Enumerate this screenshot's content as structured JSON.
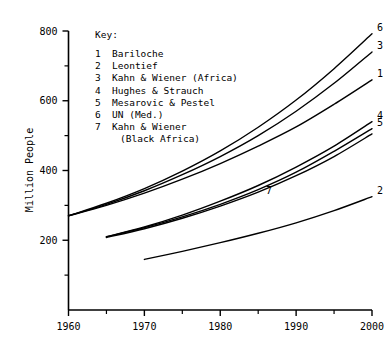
{
  "chart_data": {
    "type": "line",
    "title": "",
    "xlabel": "",
    "ylabel": "Million People",
    "xlim": [
      1960,
      2000
    ],
    "ylim": [
      0,
      800
    ],
    "grid": false,
    "legend_position": "inside-upper-left",
    "legend_title": "Key:",
    "x_ticks": [
      1960,
      1970,
      1980,
      1990,
      2000
    ],
    "x_tick_labels": [
      "1960",
      "1970",
      "1980",
      "1990",
      "2000"
    ],
    "x_minor_ticks": [
      1965,
      1975,
      1985,
      1995
    ],
    "y_ticks": [
      200,
      400,
      600,
      800
    ],
    "y_tick_labels": [
      "200",
      "400",
      "600",
      "800"
    ],
    "y_minor_ticks": [
      100,
      300,
      500,
      700
    ],
    "series": [
      {
        "key": "1",
        "name": "Bariloche",
        "label": "1",
        "x": [
          1960,
          1965,
          1970,
          1975,
          1980,
          1985,
          1990,
          1995,
          2000
        ],
        "values": [
          270,
          300,
          335,
          375,
          420,
          470,
          525,
          590,
          660
        ]
      },
      {
        "key": "2",
        "name": "Leontief",
        "label": "2",
        "x": [
          1970,
          1975,
          1980,
          1985,
          1990,
          1995,
          2000
        ],
        "values": [
          145,
          168,
          193,
          220,
          250,
          285,
          325
        ]
      },
      {
        "key": "3",
        "name": "Kahn & Wiener (Africa)",
        "label": "3",
        "x": [
          1960,
          1965,
          1970,
          1975,
          1980,
          1985,
          1990,
          1995,
          2000
        ],
        "values": [
          270,
          303,
          342,
          388,
          440,
          500,
          570,
          650,
          740
        ]
      },
      {
        "key": "4",
        "name": "Hughes & Strauch",
        "label": "4",
        "x": [
          1965,
          1970,
          1975,
          1980,
          1985,
          1990,
          1995,
          2000
        ],
        "values": [
          210,
          238,
          272,
          312,
          357,
          410,
          470,
          540
        ]
      },
      {
        "key": "5",
        "name": "Mesarovic & Pestel",
        "label": "5",
        "x": [
          1965,
          1970,
          1975,
          1980,
          1985,
          1990,
          1995,
          2000
        ],
        "values": [
          210,
          236,
          267,
          303,
          345,
          395,
          455,
          520
        ]
      },
      {
        "key": "6",
        "name": "UN (Med.)",
        "label": "6",
        "x": [
          1960,
          1965,
          1970,
          1975,
          1980,
          1985,
          1990,
          1995,
          2000
        ],
        "values": [
          270,
          306,
          348,
          398,
          456,
          524,
          602,
          692,
          792
        ]
      },
      {
        "key": "7",
        "name": "Kahn & Wiener (Black Africa)",
        "label": "7",
        "x": [
          1965,
          1970,
          1975,
          1980,
          1985,
          1990,
          1995,
          2000
        ],
        "values": [
          208,
          233,
          263,
          298,
          338,
          385,
          440,
          505
        ]
      }
    ],
    "legend_entries": [
      {
        "num": "1",
        "text": "Bariloche",
        "text2": ""
      },
      {
        "num": "2",
        "text": "Leontief",
        "text2": ""
      },
      {
        "num": "3",
        "text": "Kahn & Wiener (Africa)",
        "text2": ""
      },
      {
        "num": "4",
        "text": "Hughes & Strauch",
        "text2": ""
      },
      {
        "num": "5",
        "text": "Mesarovic & Pestel",
        "text2": ""
      },
      {
        "num": "6",
        "text": "UN (Med.)",
        "text2": ""
      },
      {
        "num": "7",
        "text": "Kahn & Wiener",
        "text2": "(Black Africa)"
      }
    ]
  }
}
